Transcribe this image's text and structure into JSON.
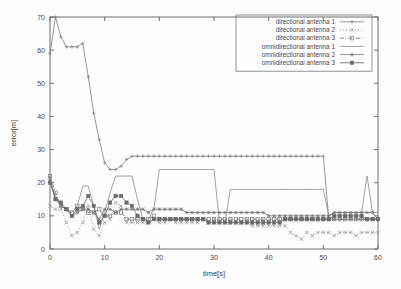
{
  "chart_data": {
    "type": "line",
    "title": "",
    "xlabel": "time[s]",
    "ylabel": "error[m]",
    "xlim": [
      0,
      60
    ],
    "ylim": [
      0,
      70
    ],
    "xticks": [
      0,
      10,
      20,
      30,
      40,
      50,
      60
    ],
    "yticks": [
      0,
      10,
      20,
      30,
      40,
      50,
      60,
      70
    ],
    "grid": false,
    "legend_position": "top-right",
    "series": [
      {
        "name": "directional antenna 1",
        "marker": "plus",
        "linestyle": "solid",
        "color": "#7d7d7d",
        "x": [
          0,
          1,
          2,
          3,
          4,
          5,
          6,
          7,
          8,
          9,
          10,
          11,
          12,
          13,
          14,
          15,
          16,
          17,
          18,
          19,
          20,
          21,
          22,
          23,
          24,
          25,
          26,
          27,
          28,
          29,
          30,
          31,
          32,
          33,
          34,
          35,
          36,
          37,
          38,
          39,
          40,
          41,
          42,
          43,
          44,
          45,
          46,
          47,
          48,
          49,
          50,
          51,
          52,
          53,
          54,
          55,
          56,
          57,
          58,
          59,
          60
        ],
        "y": [
          59,
          70,
          64,
          61,
          61,
          61,
          62,
          52,
          41,
          33,
          26,
          24,
          24,
          25,
          27,
          28,
          28,
          28,
          28,
          28,
          28,
          28,
          28,
          28,
          28,
          28,
          28,
          28,
          28,
          28,
          28,
          28,
          28,
          28,
          28,
          28,
          28,
          28,
          28,
          28,
          28,
          28,
          28,
          28,
          28,
          28,
          28,
          28,
          28,
          28,
          28,
          9,
          9,
          9,
          9,
          9,
          9,
          9,
          9,
          9,
          9
        ]
      },
      {
        "name": "directional antenna 2",
        "marker": "cross",
        "linestyle": "dotted",
        "color": "#8a8a8a",
        "x": [
          0,
          1,
          2,
          3,
          4,
          5,
          6,
          7,
          8,
          9,
          10,
          11,
          12,
          13,
          14,
          15,
          16,
          17,
          18,
          19,
          20,
          21,
          22,
          23,
          24,
          25,
          26,
          27,
          28,
          29,
          30,
          31,
          32,
          33,
          34,
          35,
          36,
          37,
          38,
          39,
          40,
          41,
          42,
          43,
          44,
          45,
          46,
          47,
          48,
          49,
          50,
          51,
          52,
          53,
          54,
          55,
          56,
          57,
          58,
          59,
          60
        ],
        "y": [
          13,
          12,
          12,
          8,
          4,
          5,
          8,
          13,
          6,
          4,
          8,
          9,
          14,
          13,
          8,
          8,
          8,
          8,
          8,
          9,
          8,
          8,
          9,
          8,
          8,
          8,
          8,
          8,
          9,
          8,
          8,
          8,
          8,
          8,
          8,
          8,
          8,
          7,
          7,
          7,
          7,
          7,
          7,
          7,
          5,
          4,
          3,
          5,
          4,
          5,
          5,
          5,
          4,
          5,
          5,
          5,
          4,
          5,
          5,
          5,
          5
        ]
      },
      {
        "name": "directional antenna 3",
        "marker": "square",
        "linestyle": "dotdash",
        "color": "#6f6f6f",
        "x": [
          0,
          1,
          2,
          3,
          4,
          5,
          6,
          7,
          8,
          9,
          10,
          11,
          12,
          13,
          14,
          15,
          16,
          17,
          18,
          19,
          20,
          21,
          22,
          23,
          24,
          25,
          26,
          27,
          28,
          29,
          30,
          31,
          32,
          33,
          34,
          35,
          36,
          37,
          38,
          39,
          40,
          41,
          42,
          43,
          44,
          45,
          46,
          47,
          48,
          49,
          50,
          51,
          52,
          53,
          54,
          55,
          56,
          57,
          58,
          59,
          60
        ],
        "y": [
          22,
          17,
          13,
          12,
          11,
          13,
          12,
          11,
          11,
          12,
          10,
          10,
          11,
          11,
          9,
          9,
          9,
          9,
          9,
          10,
          9,
          9,
          9,
          9,
          9,
          9,
          9,
          9,
          9,
          9,
          9,
          9,
          9,
          9,
          9,
          9,
          9,
          9,
          9,
          9,
          9,
          9,
          9,
          9,
          9,
          9,
          9,
          9,
          9,
          9,
          9,
          9,
          9,
          9,
          9,
          9,
          9,
          9,
          9,
          9,
          9
        ]
      },
      {
        "name": "omnidirectional antenna 1",
        "marker": "none",
        "linestyle": "solid",
        "color": "#8c8c8c",
        "x": [
          0,
          1,
          2,
          3,
          4,
          5,
          6,
          7,
          8,
          9,
          10,
          11,
          12,
          13,
          14,
          15,
          16,
          17,
          18,
          19,
          20,
          21,
          22,
          23,
          24,
          25,
          26,
          27,
          28,
          29,
          30,
          31,
          32,
          33,
          34,
          35,
          36,
          37,
          38,
          39,
          40,
          41,
          42,
          43,
          44,
          45,
          46,
          47,
          48,
          49,
          50,
          51,
          52,
          53,
          54,
          55,
          56,
          57,
          58,
          59,
          60
        ],
        "y": [
          21,
          16,
          13,
          12,
          11,
          13,
          19,
          19,
          13,
          6,
          11,
          17,
          22,
          22,
          22,
          22,
          15,
          9,
          9,
          12,
          24,
          24,
          24,
          24,
          24,
          24,
          24,
          24,
          24,
          24,
          24,
          8,
          8,
          18,
          18,
          18,
          18,
          18,
          18,
          18,
          18,
          18,
          18,
          18,
          18,
          18,
          18,
          18,
          18,
          18,
          18,
          10,
          11,
          11,
          11,
          11,
          11,
          11,
          22,
          11,
          11
        ]
      },
      {
        "name": "omnidirectional antenna 2",
        "marker": "star",
        "linestyle": "solid",
        "color": "#757575",
        "x": [
          0,
          1,
          2,
          3,
          4,
          5,
          6,
          7,
          8,
          9,
          10,
          11,
          12,
          13,
          14,
          15,
          16,
          17,
          18,
          19,
          20,
          21,
          22,
          23,
          24,
          25,
          26,
          27,
          28,
          29,
          30,
          31,
          32,
          33,
          34,
          35,
          36,
          37,
          38,
          39,
          40,
          41,
          42,
          43,
          44,
          45,
          46,
          47,
          48,
          49,
          50,
          51,
          52,
          53,
          54,
          55,
          56,
          57,
          58,
          59,
          60
        ],
        "y": [
          21,
          15,
          13,
          12,
          10,
          11,
          12,
          12,
          11,
          9,
          12,
          12,
          11,
          12,
          12,
          12,
          12,
          12,
          11,
          12,
          12,
          12,
          12,
          12,
          12,
          11,
          11,
          11,
          11,
          11,
          11,
          11,
          11,
          11,
          11,
          11,
          11,
          11,
          11,
          11,
          10,
          10,
          10,
          10,
          10,
          10,
          10,
          10,
          10,
          10,
          10,
          10,
          11,
          11,
          11,
          11,
          11,
          11,
          11,
          11,
          9
        ]
      },
      {
        "name": "omnidirectional antenna 3",
        "marker": "square-filled",
        "linestyle": "solid",
        "color": "#6a6a6a",
        "x": [
          0,
          1,
          2,
          3,
          4,
          5,
          6,
          7,
          8,
          9,
          10,
          11,
          12,
          13,
          14,
          15,
          16,
          17,
          18,
          19,
          20,
          21,
          22,
          23,
          24,
          25,
          26,
          27,
          28,
          29,
          30,
          31,
          32,
          33,
          34,
          35,
          36,
          37,
          38,
          39,
          40,
          41,
          42,
          43,
          44,
          45,
          46,
          47,
          48,
          49,
          50,
          51,
          52,
          53,
          54,
          55,
          56,
          57,
          58,
          59,
          60
        ],
        "y": [
          20,
          15,
          14,
          12,
          10,
          12,
          13,
          16,
          13,
          8,
          10,
          14,
          16,
          16,
          14,
          13,
          10,
          9,
          8,
          9,
          9,
          9,
          9,
          9,
          9,
          9,
          9,
          9,
          9,
          8,
          8,
          8,
          8,
          8,
          8,
          8,
          8,
          8,
          8,
          8,
          8,
          8,
          8,
          9,
          9,
          9,
          9,
          9,
          9,
          9,
          9,
          9,
          10,
          10,
          10,
          10,
          10,
          10,
          9,
          9,
          9
        ]
      }
    ]
  }
}
